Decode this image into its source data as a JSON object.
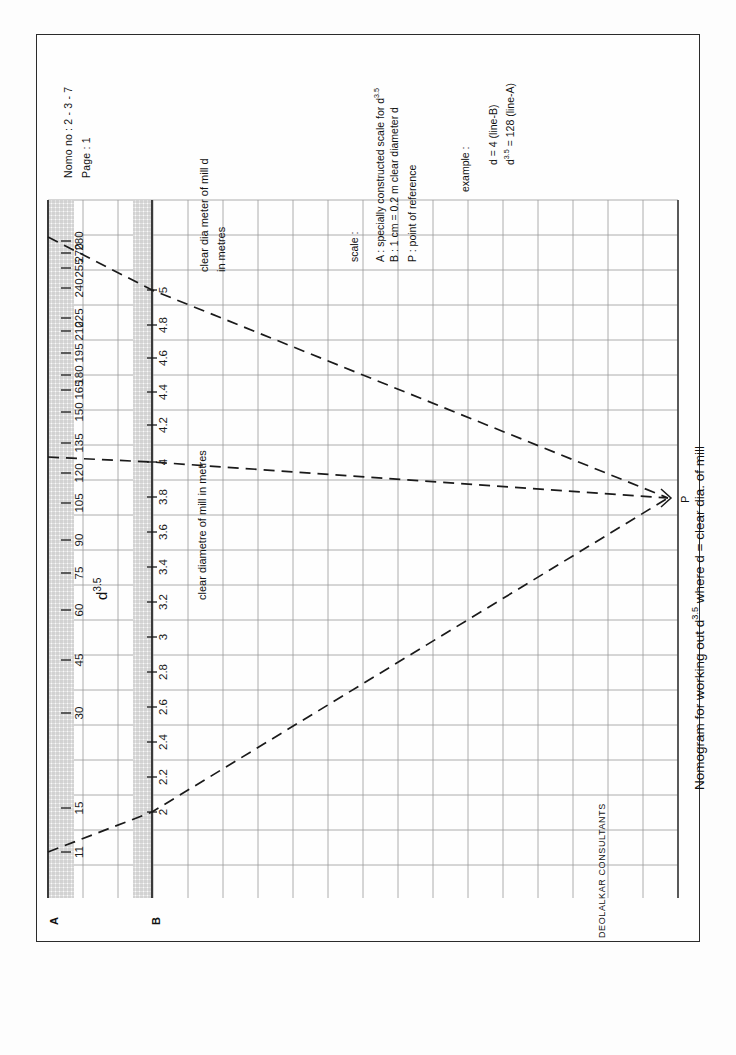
{
  "header": {
    "nomo_no": "Nomo no : 2 - 3 - 7",
    "page": "Page      : 1"
  },
  "legend": {
    "heading": "scale :",
    "items": [
      "A :  specially constructed scale for d",
      "B :  1 cm = 0.2 m clear diameter d",
      "P :  point of reference"
    ],
    "a_superscript": "3.5"
  },
  "example": {
    "heading": "example :",
    "line1": "d = 4 (line-B)",
    "line2_base": "d",
    "line2_sup": "3.5",
    "line2_rest": " = 128 (line-A)"
  },
  "axes": {
    "scale_a_label_base": "d",
    "scale_a_label_sup": "3.5",
    "scale_a_endmark": "A",
    "scale_b_endmark": "B",
    "scale_b_title_line1": "clear dia meter of mill  d",
    "scale_b_title_line2": "in metres",
    "scale_b_title_alt": "clear diametre of mill in metres"
  },
  "title": {
    "prefix": "Nomogram for working out d",
    "sup": "3.5",
    "suffix": "  where d = clear dia. of mill"
  },
  "footer": {
    "company": "DEOLALKAR CONSULTANTS"
  },
  "point_p": {
    "label": "P"
  },
  "chart_data": {
    "type": "line",
    "subtitle": "Nomo no : 2 - 3 - 7",
    "grid": true,
    "legend_position": "top-right",
    "axes_description": "Two parallel vertical scales A (d^3.5) and B (clear diameter d in metres) joined by rays through a point of reference P on the right.",
    "scales": [
      {
        "name": "A",
        "label": "d^3.5",
        "units": "",
        "orientation": "vertical",
        "x_px": 66,
        "top_value": 285,
        "bottom_value": 10,
        "tick_labels": [
          280,
          270,
          255,
          240,
          225,
          210,
          195,
          180,
          165,
          150,
          135,
          120,
          105,
          90,
          75,
          60,
          45,
          30,
          15,
          11
        ],
        "tick_values": [
          280,
          270,
          255,
          240,
          225,
          210,
          195,
          180,
          165,
          150,
          135,
          120,
          105,
          90,
          75,
          60,
          45,
          30,
          15,
          11
        ],
        "tick_y_px": [
          241,
          253,
          268,
          288,
          318,
          331,
          353,
          375,
          390,
          412,
          443,
          473,
          503,
          540,
          573,
          610,
          660,
          713,
          808,
          852
        ]
      },
      {
        "name": "B",
        "label": "clear diametre of mill in metres",
        "units": "m",
        "orientation": "vertical",
        "x_px": 152,
        "top_value": 5,
        "bottom_value": 1.8,
        "tick_labels": [
          "5",
          "4.8",
          "4.6",
          "4.4",
          "4.2",
          "4",
          "3.8",
          "3.6",
          "3.4",
          "3.2",
          "3",
          "2.8",
          "2.6",
          "2.4",
          "2.2",
          "2"
        ],
        "tick_values": [
          5,
          4.8,
          4.6,
          4.4,
          4.2,
          4,
          3.8,
          3.6,
          3.4,
          3.2,
          3,
          2.8,
          2.6,
          2.4,
          2.2,
          2
        ],
        "tick_y_px": [
          290,
          325,
          358,
          392,
          425,
          462,
          497,
          532,
          567,
          602,
          637,
          672,
          707,
          742,
          777,
          812
        ]
      }
    ],
    "reference_point": {
      "name": "P",
      "x_px": 668,
      "y_px": 498
    },
    "rays": [
      {
        "name": "upper-ray",
        "style": "dashed",
        "a_value": 285,
        "b_value": 5,
        "points_px": [
          [
            48,
            237
          ],
          [
            152,
            290
          ],
          [
            668,
            498
          ]
        ]
      },
      {
        "name": "example-ray",
        "style": "dashed",
        "a_value": 128,
        "b_value": 4,
        "label": "d = 4 (line-B) ; d^3.5 = 128 (line-A)",
        "points_px": [
          [
            48,
            457
          ],
          [
            152,
            462
          ],
          [
            668,
            498
          ]
        ]
      },
      {
        "name": "lower-ray",
        "style": "dashed",
        "a_value": 11,
        "b_value": 2,
        "points_px": [
          [
            48,
            852
          ],
          [
            152,
            812
          ],
          [
            668,
            498
          ]
        ]
      }
    ],
    "grid_spec": {
      "x_start_px": 48,
      "x_end_px": 678,
      "y_start_px": 200,
      "y_end_px": 898,
      "cell_px": 35
    }
  },
  "ticks_a": [
    {
      "v": "280",
      "y": 241
    },
    {
      "v": "270",
      "y": 253
    },
    {
      "v": "255",
      "y": 268
    },
    {
      "v": "240",
      "y": 288
    },
    {
      "v": "225",
      "y": 318
    },
    {
      "v": "210",
      "y": 331
    },
    {
      "v": "195",
      "y": 353
    },
    {
      "v": "180",
      "y": 375
    },
    {
      "v": "165",
      "y": 390
    },
    {
      "v": "150",
      "y": 412
    },
    {
      "v": "135",
      "y": 443
    },
    {
      "v": "120",
      "y": 473
    },
    {
      "v": "105",
      "y": 503
    },
    {
      "v": "90",
      "y": 540
    },
    {
      "v": "75",
      "y": 573
    },
    {
      "v": "60",
      "y": 610
    },
    {
      "v": "45",
      "y": 660
    },
    {
      "v": "30",
      "y": 713
    },
    {
      "v": "15",
      "y": 808
    },
    {
      "v": "11",
      "y": 852
    }
  ],
  "ticks_b": [
    {
      "v": "5",
      "y": 290
    },
    {
      "v": "4.8",
      "y": 325
    },
    {
      "v": "4.6",
      "y": 358
    },
    {
      "v": "4.4",
      "y": 392
    },
    {
      "v": "4.2",
      "y": 425
    },
    {
      "v": "4",
      "y": 462
    },
    {
      "v": "3.8",
      "y": 497
    },
    {
      "v": "3.6",
      "y": 532
    },
    {
      "v": "3.4",
      "y": 567
    },
    {
      "v": "3.2",
      "y": 602
    },
    {
      "v": "3",
      "y": 637
    },
    {
      "v": "2.8",
      "y": 672
    },
    {
      "v": "2.6",
      "y": 707
    },
    {
      "v": "2.4",
      "y": 742
    },
    {
      "v": "2.2",
      "y": 777
    },
    {
      "v": "2",
      "y": 812
    }
  ],
  "colors": {
    "ink": "#1a1a1a",
    "grid": "#8c8c8c",
    "axis": "#2b2b2b",
    "hatch": "#9a9a9a",
    "paper": "#fdfdfd"
  }
}
